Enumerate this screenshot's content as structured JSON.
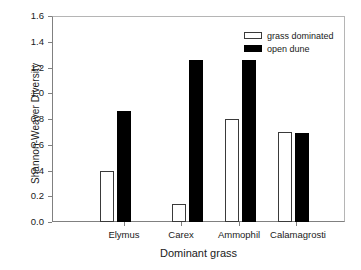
{
  "chart_data": {
    "type": "bar",
    "title": "",
    "xlabel": "Dominant grass",
    "ylabel": "Shannon-Weaver Diversity",
    "categories": [
      "Elymus",
      "Carex",
      "Ammophil",
      "Calamagrosti"
    ],
    "series": [
      {
        "name": "grass dominated",
        "color": "#ffffff",
        "edge_color": "#000000",
        "values": [
          0.4,
          0.14,
          0.8,
          0.7
        ]
      },
      {
        "name": "open dune",
        "color": "#000000",
        "edge_color": "#000000",
        "values": [
          0.86,
          1.26,
          1.26,
          0.69
        ]
      }
    ],
    "ylim": [
      0.0,
      1.6
    ],
    "ytick_labels": [
      "0.0",
      "0.2",
      "0.4",
      "0.6",
      "0.8",
      "1.0",
      "1.2",
      "1.4",
      "1.6"
    ],
    "ytick_values": [
      0.0,
      0.2,
      0.4,
      0.6,
      0.8,
      1.0,
      1.2,
      1.4,
      1.6
    ],
    "grid": false,
    "legend_position": "top-right",
    "legend_entries": [
      "grass dominated",
      "open dune"
    ]
  }
}
